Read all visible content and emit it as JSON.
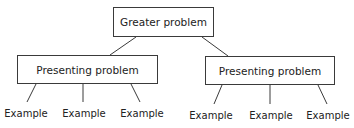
{
  "diagram": {
    "type": "tree",
    "root": {
      "label": "Greater problem"
    },
    "children": [
      {
        "label": "Presenting problem",
        "examples": [
          "Example",
          "Example",
          "Example"
        ]
      },
      {
        "label": "Presenting problem",
        "examples": [
          "Example",
          "Example",
          "Example"
        ]
      }
    ],
    "colors": {
      "stroke": "#3a3a3a",
      "text": "#222222",
      "background": "#ffffff"
    }
  }
}
